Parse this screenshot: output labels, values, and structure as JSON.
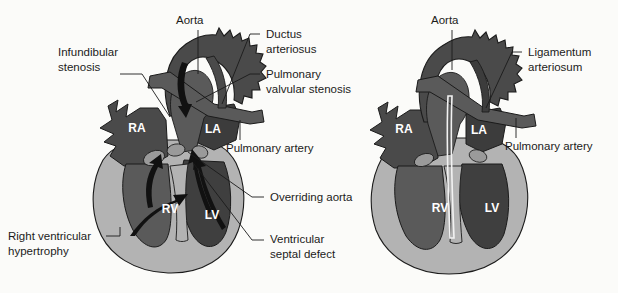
{
  "figure": {
    "background_color": "#fbfbf9"
  },
  "palette": {
    "myocardium": "#b3b3b3",
    "chamber_dark": "#4a4a4a",
    "vessel_dark": "#3c3c3c",
    "great_vessel": "#5a5a5a",
    "valve_light": "#9a9a9a",
    "outline": "#1b1b1b",
    "arrow": "#111111",
    "label_text": "#1b1b1b",
    "chamber_text": "#ffffff"
  },
  "panels": [
    {
      "id": "left-panel",
      "name": "tetralogy-of-fallot-diagram",
      "chambers": [
        {
          "key": "ra",
          "label": "RA",
          "x": 137,
          "y": 132
        },
        {
          "key": "la",
          "label": "LA",
          "x": 213,
          "y": 133
        },
        {
          "key": "rv",
          "label": "RV",
          "x": 170,
          "y": 213
        },
        {
          "key": "lv",
          "label": "LV",
          "x": 212,
          "y": 219
        }
      ],
      "labels": [
        {
          "key": "aorta",
          "text": "Aorta",
          "lines": [
            "Aorta"
          ],
          "x": 176,
          "y": 24,
          "anchor": "start",
          "leader": "M 198 30 L 198 74"
        },
        {
          "key": "infundibular-stenosis",
          "text": "Infundibular stenosis",
          "lines": [
            "Infundibular",
            "stenosis"
          ],
          "x": 58,
          "y": 56,
          "anchor": "start",
          "leader": "M 118 74 L 140 74 L 168 116"
        },
        {
          "key": "ductus-arteriosus",
          "text": "Ductus arteriosus",
          "lines": [
            "Ductus",
            "arteriosus"
          ],
          "x": 264,
          "y": 38,
          "anchor": "start",
          "leader": "M 246 42 L 256 42 M 246 42 L 224 104"
        },
        {
          "key": "pulmonary-valvular-stenosis",
          "text": "Pulmonary valvular stenosis",
          "lines": [
            "Pulmonary",
            "valvular stenosis"
          ],
          "x": 264,
          "y": 78,
          "anchor": "start",
          "leader": "M 246 80 L 256 80 M 246 80 L 196 102"
        },
        {
          "key": "pulmonary-artery",
          "text": "Pulmonary artery",
          "lines": [
            "Pulmonary artery"
          ],
          "x": 226,
          "y": 152,
          "anchor": "start",
          "leader": "M 240 118 L 240 140"
        },
        {
          "key": "overriding-aorta",
          "text": "Overriding aorta",
          "lines": [
            "Overriding aorta"
          ],
          "x": 268,
          "y": 201,
          "anchor": "start",
          "leader": "M 248 197 L 260 197 M 248 197 L 185 150"
        },
        {
          "key": "ventricular-septal-defect",
          "text": "Ventricular septal defect",
          "lines": [
            "Ventricular",
            "septal defect"
          ],
          "x": 268,
          "y": 243,
          "anchor": "start",
          "leader": "M 248 240 L 260 240 M 248 240 L 192 163"
        },
        {
          "key": "right-ventricular-hypertrophy",
          "text": "Right ventricular hypertrophy",
          "lines": [
            "Right ventricular",
            "hypertrophy"
          ],
          "x": 8,
          "y": 240,
          "anchor": "start",
          "leader": "M 104 236 L 118 236 L 118 226"
        }
      ]
    },
    {
      "id": "right-panel",
      "name": "postoperative-repair-diagram",
      "chambers": [
        {
          "key": "ra",
          "label": "RA",
          "x": 404,
          "y": 133
        },
        {
          "key": "la",
          "label": "LA",
          "x": 479,
          "y": 134
        },
        {
          "key": "rv",
          "label": "RV",
          "x": 440,
          "y": 212
        },
        {
          "key": "lv",
          "label": "LV",
          "x": 492,
          "y": 212
        }
      ],
      "labels": [
        {
          "key": "aorta",
          "text": "Aorta",
          "lines": [
            "Aorta"
          ],
          "x": 431,
          "y": 24,
          "anchor": "start",
          "leader": "M 450 30 L 450 70"
        },
        {
          "key": "ligamentum-arteriosum",
          "text": "Ligamentum arteriosum",
          "lines": [
            "Ligamentum",
            "arteriosum"
          ],
          "x": 527,
          "y": 56,
          "anchor": "start",
          "leader": "M 510 58 L 520 58 M 510 58 L 486 104"
        },
        {
          "key": "pulmonary-artery",
          "text": "Pulmonary artery",
          "lines": [
            "Pulmonary artery"
          ],
          "x": 505,
          "y": 150,
          "anchor": "start",
          "leader": "M 516 116 L 516 138"
        }
      ]
    }
  ]
}
